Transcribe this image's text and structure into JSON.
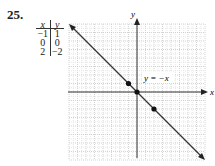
{
  "problem": {
    "number": "25."
  },
  "table": {
    "headers": [
      "x",
      "y"
    ],
    "rows": [
      [
        "−1",
        "1"
      ],
      [
        "0",
        "0"
      ],
      [
        "2",
        "−2"
      ]
    ]
  },
  "graph": {
    "x_axis_label": "x",
    "y_axis_label": "y",
    "equation_label": "y = −x",
    "range": {
      "xmin": -8,
      "xmax": 8,
      "ymin": -8,
      "ymax": 8
    },
    "points": [
      [
        -1,
        1
      ],
      [
        0,
        0
      ],
      [
        2,
        -2
      ]
    ],
    "line": {
      "slope": -1,
      "intercept": 0
    }
  },
  "chart_data": {
    "type": "line",
    "title": "y = −x",
    "xlabel": "x",
    "ylabel": "y",
    "xlim": [
      -8,
      8
    ],
    "ylim": [
      -8,
      8
    ],
    "grid": true,
    "series": [
      {
        "name": "y = −x",
        "x": [
          -1,
          0,
          2
        ],
        "y": [
          1,
          0,
          -2
        ]
      }
    ]
  }
}
